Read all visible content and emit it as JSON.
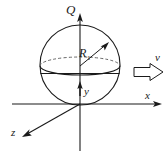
{
  "figure": {
    "background_color": "#ffffff",
    "stroke_color": "#1a1a1a",
    "dashed_stroke_color": "#555555",
    "width": 168,
    "height": 158
  },
  "labels": {
    "q_axis": "Q",
    "radius": "R",
    "radius_subscript": "1",
    "velocity": "v",
    "x_axis": "x",
    "y_axis": "y",
    "z_axis": "z"
  },
  "geometry": {
    "origin": {
      "x": 80,
      "y": 104
    },
    "sphere": {
      "center_x": 80,
      "center_y": 65,
      "radius": 40
    },
    "equator_ellipse": {
      "center_x": 80,
      "center_y": 66,
      "rx": 40,
      "ry": 9
    },
    "q_axis_line": {
      "x1": 80,
      "y1": 15,
      "x2": 80,
      "y2": 151
    },
    "x_axis_line": {
      "x1": 12,
      "y1": 104,
      "x2": 161,
      "y2": 104
    },
    "z_axis_line": {
      "x1": 80,
      "y1": 104,
      "x2": 23,
      "y2": 137
    },
    "radius_arrow": {
      "x1": 80,
      "y1": 66,
      "x2": 108,
      "y2": 43
    },
    "y_arrow": {
      "x1": 80,
      "y1": 95,
      "x2": 80,
      "y2": 82
    },
    "velocity_block_arrow": {
      "x": 134,
      "y": 64,
      "width": 29,
      "height": 16
    }
  },
  "icons": {
    "q_axis_arrowhead": "arrow-up-icon",
    "x_axis_arrowhead": "arrow-right-icon",
    "z_axis_arrowhead": "arrow-down-left-icon",
    "radius_arrowhead": "arrow-up-right-icon",
    "y_arrowhead": "arrow-up-icon",
    "velocity_arrow": "block-arrow-right-icon"
  }
}
